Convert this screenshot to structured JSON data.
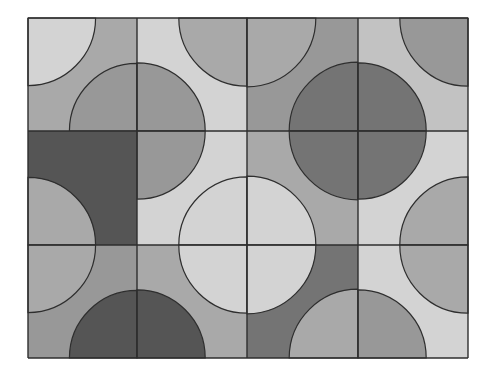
{
  "board": {
    "x0": 28,
    "y0": 18,
    "cols": [
      28,
      137,
      247,
      358,
      468
    ],
    "rows": [
      18,
      131,
      245,
      358
    ],
    "stroke": "#2e2e2e",
    "radius": 56
  },
  "palette": {
    "vlight": "#d3d3d3",
    "light": "#c2c2c2",
    "mid": "#a9a9a9",
    "middark": "#989898",
    "dark": "#747474",
    "darkest": "#555555"
  },
  "tiles": [
    {
      "row": 0,
      "col": 0,
      "base": "mid",
      "corners": {
        "tl": "vlight",
        "br": "middark"
      }
    },
    {
      "row": 0,
      "col": 1,
      "base": "vlight",
      "corners": {
        "tr": "mid",
        "bl": "middark"
      }
    },
    {
      "row": 0,
      "col": 2,
      "base": "middark",
      "corners": {
        "tl": "mid",
        "br": "dark"
      }
    },
    {
      "row": 0,
      "col": 3,
      "base": "light",
      "corners": {
        "tr": "middark",
        "bl": "dark"
      }
    },
    {
      "row": 1,
      "col": 0,
      "base": "darkest",
      "corners": {
        "bl": "mid"
      }
    },
    {
      "row": 1,
      "col": 1,
      "base": "vlight",
      "corners": {
        "tl": "middark",
        "br": "vlight"
      }
    },
    {
      "row": 1,
      "col": 2,
      "base": "mid",
      "corners": {
        "tr": "dark",
        "bl": "vlight"
      }
    },
    {
      "row": 1,
      "col": 3,
      "base": "vlight",
      "corners": {
        "tl": "dark",
        "br": "mid"
      }
    },
    {
      "row": 2,
      "col": 0,
      "base": "middark",
      "corners": {
        "tl": "mid",
        "br": "darkest"
      }
    },
    {
      "row": 2,
      "col": 1,
      "base": "mid",
      "corners": {
        "tr": "vlight",
        "bl": "darkest"
      }
    },
    {
      "row": 2,
      "col": 2,
      "base": "dark",
      "corners": {
        "tl": "vlight",
        "br": "mid"
      }
    },
    {
      "row": 2,
      "col": 3,
      "base": "vlight",
      "corners": {
        "tr": "mid",
        "bl": "middark"
      }
    }
  ]
}
